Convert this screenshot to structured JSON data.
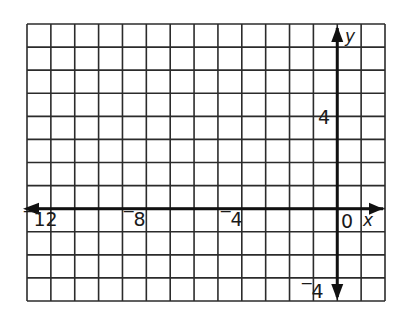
{
  "diagram": {
    "type": "coordinate-grid",
    "grid": {
      "x_min": -13,
      "x_max": 2,
      "y_min": -4,
      "y_max": 8,
      "left_px": 27,
      "top_px": 24,
      "right_px": 385,
      "bottom_px": 301,
      "line_color": "#2b2b2b",
      "axis_color": "#111111"
    },
    "axes": {
      "x_label": "x",
      "y_label": "y",
      "x_arrows": "both",
      "y_arrows": "both"
    },
    "tick_labels": {
      "x": [
        {
          "value": -12,
          "text": "‾12"
        },
        {
          "value": -8,
          "text": "‾8"
        },
        {
          "value": -4,
          "text": "‾4"
        },
        {
          "value": 0,
          "text": "0"
        }
      ],
      "y": [
        {
          "value": 4,
          "text": "4"
        },
        {
          "value": -4,
          "text": "‾4"
        }
      ]
    }
  }
}
